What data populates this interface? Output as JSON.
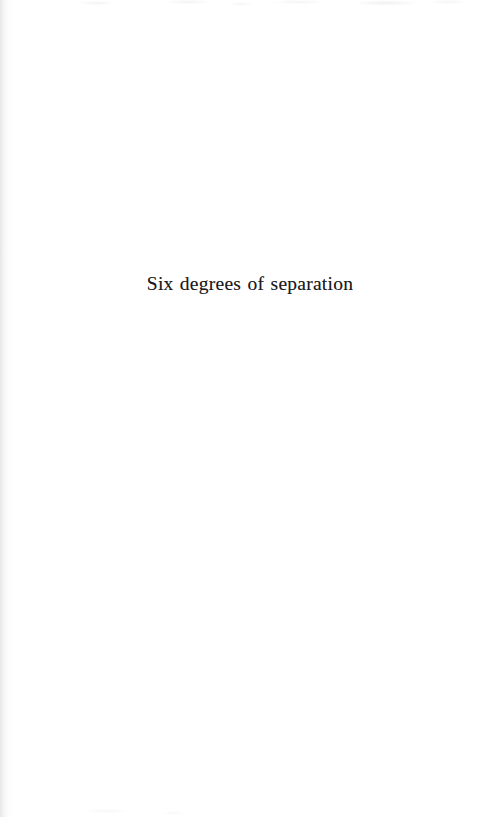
{
  "page": {
    "kind": "scanned-book-page",
    "background_color": "#ffffff",
    "width": 482,
    "height": 817,
    "text_color": "#1b1b1d"
  },
  "content": {
    "section_title": "Six degrees of separation"
  },
  "artifacts": {
    "left_edge_shadow": "faint grey scan shadow along left gutter",
    "top_noise": "faint speckle band across top trim",
    "bottom_noise": "faint speckle near lower-left"
  }
}
